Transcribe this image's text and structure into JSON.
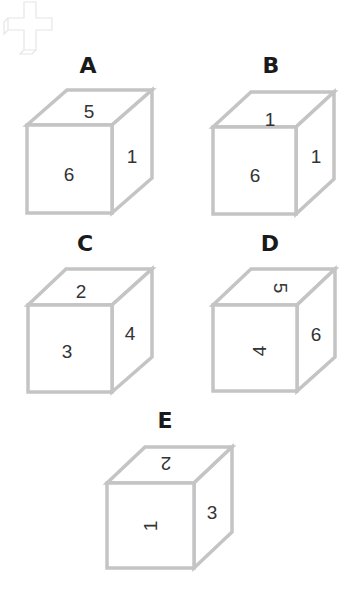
{
  "watermark": {
    "icon": "plus-cross-watermark-icon"
  },
  "style": {
    "edge_color": "#c4c4c4",
    "text_color": "#333333",
    "label_color": "#1a1a1a"
  },
  "cubes": [
    {
      "label": "A",
      "top": "5",
      "front": "6",
      "right": "1",
      "top_rot": 0,
      "front_rot": 0,
      "right_rot": 0
    },
    {
      "label": "B",
      "top": "1",
      "front": "6",
      "right": "1",
      "top_rot": 0,
      "front_rot": 0,
      "right_rot": 0
    },
    {
      "label": "C",
      "top": "2",
      "front": "3",
      "right": "4",
      "top_rot": 0,
      "front_rot": 0,
      "right_rot": 0
    },
    {
      "label": "D",
      "top": "5",
      "front": "4",
      "right": "6",
      "top_rot": 90,
      "front_rot": -90,
      "right_rot": 0
    },
    {
      "label": "E",
      "top": "2",
      "front": "1",
      "right": "3",
      "top_rot": 180,
      "front_rot": -90,
      "right_rot": 0
    }
  ]
}
